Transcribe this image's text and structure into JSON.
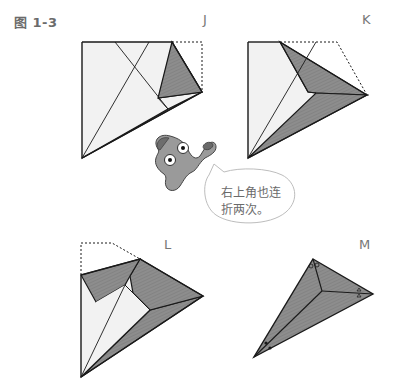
{
  "figure": {
    "label": "图 1-3"
  },
  "steps": [
    {
      "id": "J",
      "label": "J"
    },
    {
      "id": "K",
      "label": "K"
    },
    {
      "id": "L",
      "label": "L"
    },
    {
      "id": "M",
      "label": "M"
    }
  ],
  "mascot": {
    "speech": [
      "右上角也连",
      "折两次。"
    ]
  },
  "colors": {
    "paper_light": "#f2f2f2",
    "paper_dark": "#8a8a8a",
    "outline": "#1a1a1a",
    "label_text": "#6b6b6b"
  }
}
